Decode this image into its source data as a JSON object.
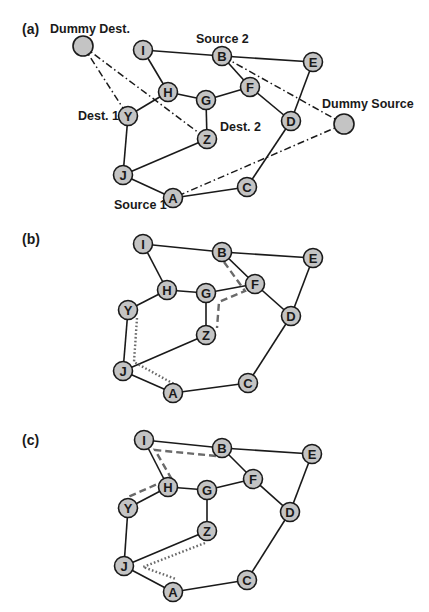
{
  "figure": {
    "node_radius": 9.5,
    "dummy_radius": 10,
    "colors": {
      "node_fill": "#c4c4c4",
      "stroke": "#1a1a1a",
      "path": "#6a6a6a"
    }
  },
  "panels": [
    {
      "id": "a",
      "label": "(a)",
      "label_pos": [
        22,
        34
      ],
      "nodes": {
        "I": [
          143,
          50
        ],
        "B": [
          222,
          56
        ],
        "E": [
          313,
          62
        ],
        "F": [
          250,
          87
        ],
        "H": [
          168,
          92
        ],
        "G": [
          206,
          100
        ],
        "Y": [
          128,
          116
        ],
        "D": [
          291,
          121
        ],
        "Z": [
          207,
          139
        ],
        "J": [
          123,
          175
        ],
        "C": [
          247,
          187
        ],
        "A": [
          173,
          198
        ]
      },
      "dummies": {
        "DummyDest": [
          83,
          46
        ],
        "DummySource": [
          344,
          124
        ]
      },
      "edges": [
        [
          "I",
          "B"
        ],
        [
          "B",
          "E"
        ],
        [
          "I",
          "H"
        ],
        [
          "B",
          "F"
        ],
        [
          "H",
          "G"
        ],
        [
          "G",
          "F"
        ],
        [
          "H",
          "Y"
        ],
        [
          "F",
          "D"
        ],
        [
          "E",
          "D"
        ],
        [
          "G",
          "Z"
        ],
        [
          "Y",
          "J"
        ],
        [
          "Z",
          "J"
        ],
        [
          "J",
          "A"
        ],
        [
          "A",
          "C"
        ],
        [
          "C",
          "D"
        ]
      ],
      "virtual_edges": [
        [
          "DummyDest",
          "Y"
        ],
        [
          "DummyDest",
          "Z"
        ],
        [
          "DummySource",
          "B"
        ],
        [
          "DummySource",
          "A"
        ]
      ],
      "texts": [
        {
          "text": "Dummy Dest.",
          "pos": [
            50,
            33
          ]
        },
        {
          "text": "Source 2",
          "pos": [
            196,
            43
          ]
        },
        {
          "text": "Dest. 1",
          "pos": [
            78,
            120
          ]
        },
        {
          "text": "Dest. 2",
          "pos": [
            220,
            131
          ]
        },
        {
          "text": "Dummy Source",
          "pos": [
            322,
            108
          ]
        },
        {
          "text": "Source 1",
          "pos": [
            114,
            209
          ]
        }
      ],
      "dashed_paths": [],
      "dotted_paths": []
    },
    {
      "id": "b",
      "label": "(b)",
      "label_pos": [
        22,
        244
      ],
      "nodes": {
        "I": [
          143,
          244
        ],
        "B": [
          222,
          252
        ],
        "E": [
          313,
          258
        ],
        "F": [
          255,
          284
        ],
        "H": [
          167,
          290
        ],
        "G": [
          206,
          293
        ],
        "Y": [
          128,
          310
        ],
        "D": [
          291,
          316
        ],
        "Z": [
          206,
          335
        ],
        "J": [
          123,
          371
        ],
        "C": [
          248,
          383
        ],
        "A": [
          173,
          393
        ]
      },
      "dummies": {},
      "edges": [
        [
          "I",
          "B"
        ],
        [
          "B",
          "E"
        ],
        [
          "I",
          "H"
        ],
        [
          "B",
          "F"
        ],
        [
          "H",
          "G"
        ],
        [
          "G",
          "F"
        ],
        [
          "H",
          "Y"
        ],
        [
          "F",
          "D"
        ],
        [
          "E",
          "D"
        ],
        [
          "G",
          "Z"
        ],
        [
          "Y",
          "J"
        ],
        [
          "Z",
          "J"
        ],
        [
          "J",
          "A"
        ],
        [
          "A",
          "C"
        ],
        [
          "C",
          "D"
        ]
      ],
      "virtual_edges": [],
      "texts": [],
      "dashed_paths": [
        [
          [
            224,
            262
          ],
          [
            245,
            291
          ],
          [
            219,
            302
          ],
          [
            217,
            328
          ]
        ]
      ],
      "dotted_paths": [
        [
          [
            137,
            318
          ],
          [
            134,
            362
          ],
          [
            174,
            384
          ]
        ]
      ]
    },
    {
      "id": "c",
      "label": "(c)",
      "label_pos": [
        22,
        445
      ],
      "nodes": {
        "I": [
          144,
          440
        ],
        "B": [
          222,
          448
        ],
        "E": [
          312,
          454
        ],
        "F": [
          253,
          479
        ],
        "H": [
          168,
          487
        ],
        "G": [
          207,
          490
        ],
        "Y": [
          128,
          508
        ],
        "D": [
          290,
          512
        ],
        "Z": [
          207,
          531
        ],
        "J": [
          124,
          566
        ],
        "C": [
          247,
          580
        ],
        "A": [
          173,
          592
        ]
      },
      "dummies": {},
      "edges": [
        [
          "I",
          "B"
        ],
        [
          "B",
          "E"
        ],
        [
          "I",
          "H"
        ],
        [
          "B",
          "F"
        ],
        [
          "H",
          "G"
        ],
        [
          "G",
          "F"
        ],
        [
          "H",
          "Y"
        ],
        [
          "F",
          "D"
        ],
        [
          "E",
          "D"
        ],
        [
          "G",
          "Z"
        ],
        [
          "Y",
          "J"
        ],
        [
          "Z",
          "J"
        ],
        [
          "J",
          "A"
        ],
        [
          "A",
          "C"
        ],
        [
          "C",
          "D"
        ]
      ],
      "virtual_edges": [],
      "texts": [],
      "dashed_paths": [
        [
          [
            216,
            456
          ],
          [
            155,
            450
          ],
          [
            171,
            478
          ],
          [
            128,
            497
          ]
        ]
      ],
      "dotted_paths": [
        [
          [
            205,
            543
          ],
          [
            143,
            567
          ],
          [
            176,
            579
          ]
        ]
      ]
    }
  ]
}
